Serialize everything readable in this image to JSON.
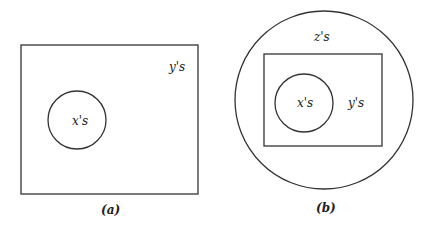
{
  "diagram_a": {
    "caption": "(a)",
    "outer_set_label": "y's",
    "inner_set_label": "x's"
  },
  "diagram_b": {
    "caption": "(b)",
    "outermost_set_label": "z's",
    "middle_set_label": "y's",
    "inner_set_label": "x's"
  },
  "colors": {
    "stroke": "#333333",
    "text": "#222222",
    "background": "#ffffff"
  }
}
